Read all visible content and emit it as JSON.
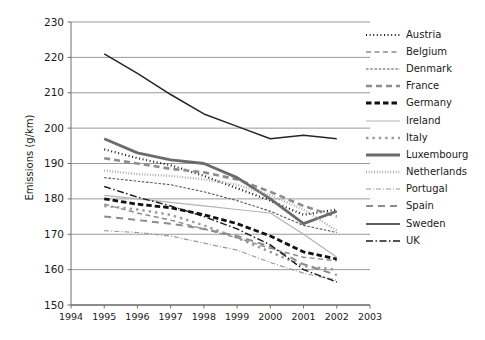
{
  "chart_data": {
    "type": "line",
    "title": "",
    "xlabel": "",
    "ylabel": "Emissions (g/km)",
    "xlim": [
      1994,
      2003
    ],
    "ylim": [
      150,
      230
    ],
    "ytick_step": 10,
    "grid": true,
    "legend_position": "right",
    "yticks": [
      "230",
      "220",
      "210",
      "200",
      "190",
      "180",
      "170",
      "160",
      "150"
    ],
    "xticks": [
      "1994",
      "1995",
      "1996",
      "1997",
      "1998",
      "1999",
      "2000",
      "2001",
      "2002",
      "2003"
    ],
    "x": [
      1995,
      1996,
      1997,
      1998,
      1999,
      2000,
      2001,
      2002
    ],
    "series": [
      {
        "name": "Austria",
        "style": "dotted-square",
        "color": "#1a1a1a",
        "width": 2.2,
        "dash": "1,2.6",
        "values": [
          194.0,
          191.5,
          189.5,
          186.5,
          183.0,
          179.5,
          175.5,
          177.0
        ]
      },
      {
        "name": "Belgium",
        "style": "dashed-light",
        "color": "#8c8c8c",
        "width": 1.4,
        "dash": "5,3.5",
        "values": [
          178.5,
          176.0,
          174.0,
          171.5,
          169.0,
          166.0,
          163.5,
          162.5
        ]
      },
      {
        "name": "Denmark",
        "style": "fine-dash",
        "color": "#595959",
        "width": 1.1,
        "dash": "2.6,1.6",
        "values": [
          186.0,
          185.0,
          184.0,
          182.0,
          179.5,
          176.5,
          172.5,
          170.5
        ]
      },
      {
        "name": "France",
        "style": "long-dash",
        "color": "#8c8c8c",
        "width": 2.6,
        "dash": "6,4",
        "values": [
          191.5,
          190.0,
          188.5,
          187.5,
          185.5,
          182.0,
          178.0,
          175.0
        ]
      },
      {
        "name": "Germany",
        "style": "thick-dash",
        "color": "#111111",
        "width": 2.8,
        "dash": "5.5,3",
        "values": [
          180.0,
          178.5,
          177.5,
          175.5,
          173.0,
          169.5,
          165.0,
          163.0
        ]
      },
      {
        "name": "Ireland",
        "style": "thin-solid",
        "color": "#b3b3b3",
        "width": 1.2,
        "dash": "",
        "values": [
          181.0,
          180.0,
          179.0,
          178.0,
          177.0,
          176.0,
          170.0,
          163.5
        ]
      },
      {
        "name": "Italy",
        "style": "square-dot",
        "color": "#9a9a9a",
        "width": 2.4,
        "dash": "2.4,4",
        "values": [
          178.0,
          177.0,
          175.5,
          172.5,
          169.0,
          165.0,
          161.0,
          160.0
        ]
      },
      {
        "name": "Luxembourg",
        "style": "thick-solid-grey",
        "color": "#6b6b6b",
        "width": 2.8,
        "dash": "",
        "values": [
          197.0,
          193.0,
          191.0,
          190.0,
          186.0,
          180.0,
          173.0,
          176.5
        ]
      },
      {
        "name": "Netherlands",
        "style": "dense-dot",
        "color": "#a5a5a5",
        "width": 2.4,
        "dash": "0.9,1.8",
        "values": [
          188.0,
          187.0,
          186.5,
          185.5,
          184.0,
          181.0,
          177.0,
          171.0
        ]
      },
      {
        "name": "Portugal",
        "style": "dash-dot-light",
        "color": "#9a9a9a",
        "width": 1.2,
        "dash": "5,2,1,2",
        "values": [
          171.0,
          170.5,
          169.5,
          167.5,
          165.5,
          162.0,
          159.0,
          157.0
        ]
      },
      {
        "name": "Spain",
        "style": "wide-dash",
        "color": "#8c8c8c",
        "width": 2.0,
        "dash": "7,5",
        "values": [
          175.0,
          174.0,
          173.0,
          171.5,
          169.5,
          166.5,
          161.5,
          158.5
        ]
      },
      {
        "name": "Sweden",
        "style": "solid-dark",
        "color": "#262626",
        "width": 1.5,
        "dash": "",
        "values": [
          221.0,
          215.5,
          209.5,
          204.0,
          200.5,
          197.0,
          198.0,
          197.0
        ]
      },
      {
        "name": "UK",
        "style": "dash-dot-dark",
        "color": "#1a1a1a",
        "width": 1.4,
        "dash": "7,2.5,1.5,2.5",
        "values": [
          183.5,
          180.5,
          178.0,
          175.0,
          171.5,
          167.0,
          160.0,
          156.5
        ]
      }
    ]
  }
}
